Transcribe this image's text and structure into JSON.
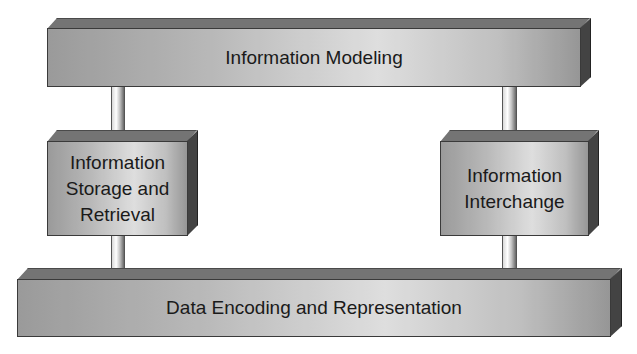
{
  "diagram": {
    "layers": {
      "top": {
        "label": "Information Modeling"
      },
      "left_middle": {
        "label": "Information\nStorage and\nRetrieval"
      },
      "right_middle": {
        "label": "Information\nInterchange"
      },
      "bottom": {
        "label": "Data Encoding and Representation"
      }
    },
    "connectors": [
      {
        "from": "top",
        "to": "left_middle"
      },
      {
        "from": "left_middle",
        "to": "bottom"
      },
      {
        "from": "top",
        "to": "right_middle"
      },
      {
        "from": "right_middle",
        "to": "bottom"
      }
    ],
    "colors": {
      "face_light": "#f2f2f2",
      "face_dark": "#a8a8a8",
      "top_face": "#8a8a8a",
      "side_face": "#555555",
      "text": "#1a1a1a"
    }
  }
}
